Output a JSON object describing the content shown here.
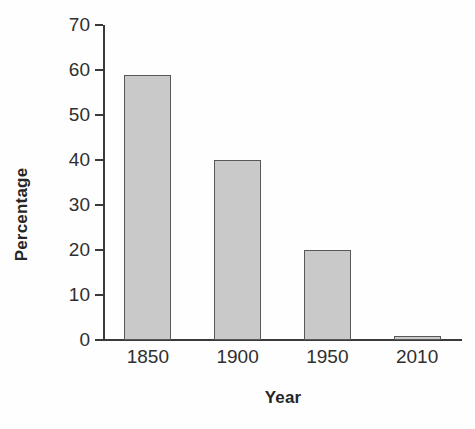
{
  "chart_data": {
    "type": "bar",
    "title": "",
    "xlabel": "Year",
    "ylabel": "Percentage",
    "categories": [
      "1850",
      "1900",
      "1950",
      "2010"
    ],
    "values": [
      59,
      40,
      20,
      1
    ],
    "ylim": [
      0,
      70
    ],
    "yticks": [
      0,
      10,
      20,
      30,
      40,
      50,
      60,
      70
    ],
    "ytick_labels": [
      "0",
      "10",
      "20",
      "30",
      "40",
      "50",
      "60",
      "70"
    ],
    "grid": false,
    "legend": null,
    "series": [
      {
        "name": "Percentage",
        "values": [
          59,
          40,
          20,
          1
        ],
        "fill_color": "#c9c9c9",
        "edge_color": "#585858"
      }
    ],
    "axis_color": "#3a3a3a",
    "background_color": "#ffffff"
  }
}
